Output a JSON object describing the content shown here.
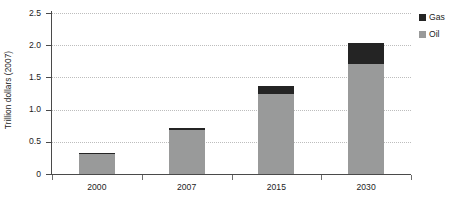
{
  "chart_data": {
    "type": "bar",
    "subtype": "stacked-vertical",
    "title": "",
    "xlabel": "",
    "ylabel": "Trillion dollars (2007)",
    "categories": [
      "2000",
      "2007",
      "2015",
      "2030"
    ],
    "series": [
      {
        "name": "Oil",
        "color": "#999a9a",
        "values": [
          0.31,
          0.69,
          1.25,
          1.71
        ]
      },
      {
        "name": "Gas",
        "color": "#242424",
        "values": [
          0.02,
          0.03,
          0.11,
          0.32
        ]
      }
    ],
    "stack_order": [
      "Oil",
      "Gas"
    ],
    "totals": [
      0.33,
      0.72,
      1.36,
      2.03
    ],
    "ylim": [
      0,
      2.5
    ],
    "yticks": [
      0,
      0.5,
      1.0,
      1.5,
      2.0,
      2.5
    ],
    "ytick_labels": [
      "0",
      "0.5",
      "1.0",
      "1.5",
      "2.0",
      "2.5"
    ],
    "grid": true,
    "grid_axis": "y",
    "grid_style": "dotted",
    "legend_position": "right-top",
    "legend_entries": [
      {
        "label": "Gas",
        "color": "#242424"
      },
      {
        "label": "Oil",
        "color": "#999a9a"
      }
    ]
  },
  "axes": {
    "y_title": "Trillion dollars (2007)",
    "y_labels": [
      "2.5",
      "2.0",
      "1.5",
      "1.0",
      "0.5",
      "0"
    ],
    "x_labels": [
      "2000",
      "2007",
      "2015",
      "2030"
    ]
  },
  "legend": {
    "items": [
      {
        "label": "Gas"
      },
      {
        "label": "Oil"
      }
    ]
  },
  "colors": {
    "oil": "#999a9a",
    "gas": "#242424",
    "axis": "#4a4a4a",
    "grid": "#bdbdbd",
    "text": "#1c1c1c",
    "background": "#ffffff"
  }
}
